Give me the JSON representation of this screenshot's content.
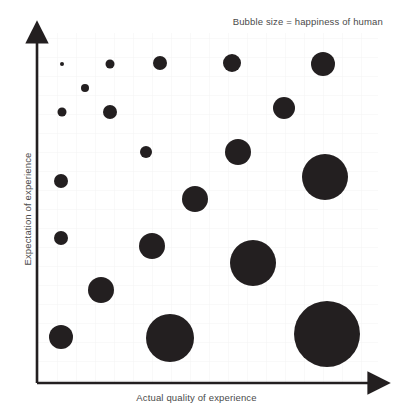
{
  "annotation": {
    "text": "Bubble size = happiness of human"
  },
  "axes": {
    "x_label": "Actual quality of experience",
    "y_label": "Expectation of experience"
  },
  "style": {
    "bubble_color": "#231f20",
    "axis_color": "#231f20",
    "grid_color": "#f2f2f2",
    "plot_background": "#ffffff",
    "text_color": "#4a4a4a"
  },
  "chart_data": {
    "type": "scatter",
    "title": "",
    "subtitle": "",
    "annotations": [
      "Bubble size = happiness of human"
    ],
    "xlabel": "Actual quality of experience",
    "ylabel": "Expectation of experience",
    "xlim": [
      0,
      10
    ],
    "ylim": [
      0,
      10
    ],
    "grid": true,
    "legend": "none",
    "axis_ticks": [],
    "size_encoding": "happiness of human",
    "points": [
      {
        "id": "p1",
        "x": 0.7,
        "y": 9.3,
        "r": 2.0,
        "size": 1
      },
      {
        "id": "p2",
        "x": 2.1,
        "y": 9.3,
        "r": 4.5,
        "size": 5
      },
      {
        "id": "p3",
        "x": 3.6,
        "y": 9.4,
        "r": 7.0,
        "size": 12
      },
      {
        "id": "p4",
        "x": 5.7,
        "y": 9.4,
        "r": 9.0,
        "size": 20
      },
      {
        "id": "p5",
        "x": 8.4,
        "y": 9.3,
        "r": 12.0,
        "size": 36
      },
      {
        "id": "p6",
        "x": 1.4,
        "y": 8.6,
        "r": 4.0,
        "size": 4
      },
      {
        "id": "p7",
        "x": 7.2,
        "y": 8.0,
        "r": 11.0,
        "size": 30
      },
      {
        "id": "p8",
        "x": 0.7,
        "y": 7.9,
        "r": 4.5,
        "size": 5
      },
      {
        "id": "p9",
        "x": 2.1,
        "y": 7.9,
        "r": 7.0,
        "size": 12
      },
      {
        "id": "p10",
        "x": 3.2,
        "y": 6.7,
        "r": 6.0,
        "size": 9
      },
      {
        "id": "p11",
        "x": 5.9,
        "y": 6.7,
        "r": 13.0,
        "size": 42
      },
      {
        "id": "p12",
        "x": 8.5,
        "y": 6.0,
        "r": 23.0,
        "size": 132
      },
      {
        "id": "p13",
        "x": 0.7,
        "y": 5.9,
        "r": 7.0,
        "size": 12
      },
      {
        "id": "p14",
        "x": 4.7,
        "y": 5.3,
        "r": 13.0,
        "size": 42
      },
      {
        "id": "p15",
        "x": 0.7,
        "y": 4.2,
        "r": 7.0,
        "size": 12
      },
      {
        "id": "p16",
        "x": 3.4,
        "y": 3.9,
        "r": 13.0,
        "size": 42
      },
      {
        "id": "p17",
        "x": 6.3,
        "y": 3.4,
        "r": 23.0,
        "size": 132
      },
      {
        "id": "p18",
        "x": 1.9,
        "y": 2.7,
        "r": 13.0,
        "size": 42
      },
      {
        "id": "p19",
        "x": 0.7,
        "y": 1.3,
        "r": 12.0,
        "size": 36
      },
      {
        "id": "p20",
        "x": 3.9,
        "y": 1.3,
        "r": 24.0,
        "size": 144
      },
      {
        "id": "p21",
        "x": 8.5,
        "y": 1.4,
        "r": 33.0,
        "size": 272
      }
    ]
  },
  "bubbles": [
    {
      "cx": 62,
      "cy": 64,
      "r": 2.0
    },
    {
      "cx": 110,
      "cy": 64,
      "r": 4.5
    },
    {
      "cx": 160,
      "cy": 63,
      "r": 7.0
    },
    {
      "cx": 232,
      "cy": 63,
      "r": 9.0
    },
    {
      "cx": 323,
      "cy": 64,
      "r": 12.0
    },
    {
      "cx": 85,
      "cy": 88,
      "r": 4.0
    },
    {
      "cx": 284,
      "cy": 108,
      "r": 11.0
    },
    {
      "cx": 62,
      "cy": 112,
      "r": 4.5
    },
    {
      "cx": 110,
      "cy": 112,
      "r": 7.0
    },
    {
      "cx": 146,
      "cy": 152,
      "r": 6.0
    },
    {
      "cx": 238,
      "cy": 152,
      "r": 13.0
    },
    {
      "cx": 325,
      "cy": 177,
      "r": 23.0
    },
    {
      "cx": 61,
      "cy": 181,
      "r": 7.0
    },
    {
      "cx": 195,
      "cy": 199,
      "r": 13.0
    },
    {
      "cx": 61,
      "cy": 238,
      "r": 7.0
    },
    {
      "cx": 152,
      "cy": 246,
      "r": 13.0
    },
    {
      "cx": 253,
      "cy": 263,
      "r": 23.0
    },
    {
      "cx": 101,
      "cy": 290,
      "r": 13.0
    },
    {
      "cx": 61,
      "cy": 337,
      "r": 12.0
    },
    {
      "cx": 170,
      "cy": 338,
      "r": 24.0
    },
    {
      "cx": 327,
      "cy": 334,
      "r": 33.0
    }
  ],
  "geometry": {
    "x_axis_y": 383,
    "y_axis_x": 37,
    "plot_left": 37,
    "plot_right": 378,
    "plot_top": 33,
    "plot_bottom": 383,
    "grid_step": 19
  }
}
